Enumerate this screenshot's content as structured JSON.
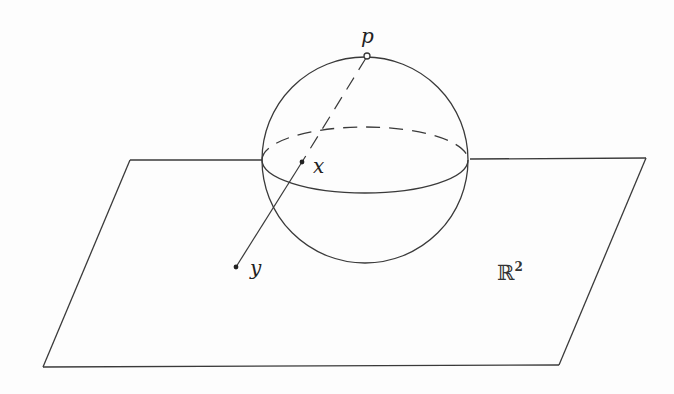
{
  "figure": {
    "labels": {
      "north_pole": "p",
      "sphere_point": "x",
      "plane_point": "y",
      "plane_name": "ℝ",
      "plane_exponent": "2"
    },
    "colors": {
      "stroke": "#3a3a3a",
      "background": "#fdfdfd"
    }
  }
}
